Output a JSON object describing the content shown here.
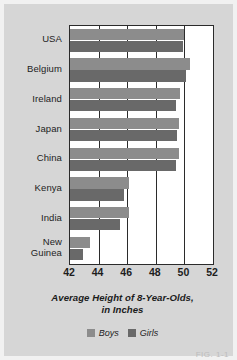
{
  "figure": {
    "caption": "FIG. 1-1",
    "background_color": "#d6d6d6",
    "frame_color": "#f1f1f1"
  },
  "legend": {
    "position": "bottom-center",
    "entries": [
      {
        "label": "Boys",
        "color": "#8c8c8c"
      },
      {
        "label": "Girls",
        "color": "#696969"
      }
    ]
  },
  "axis_title": {
    "line1": "Average Height of 8-Year-Olds,",
    "line2": "in Inches"
  },
  "chart_data": {
    "type": "bar",
    "orientation": "horizontal",
    "title": "Average Height of 8-Year-Olds, in Inches",
    "xlabel": "Average Height of 8-Year-Olds, in Inches",
    "ylabel": "",
    "xlim": [
      42,
      52
    ],
    "ylim": null,
    "xticks": [
      42,
      44,
      46,
      48,
      50,
      52
    ],
    "tick_labels": [
      "42",
      "44",
      "46",
      "48",
      "50",
      "52"
    ],
    "grid": true,
    "grid_axis": "x",
    "legend_position": "bottom-center",
    "categories": [
      "USA",
      "Belgium",
      "Ireland",
      "Japan",
      "China",
      "Kenya",
      "India",
      "New Guinea"
    ],
    "category_labels_multiline": {
      "New Guinea": [
        "New",
        "Guinea"
      ]
    },
    "series": [
      {
        "name": "Boys",
        "color": "#8c8c8c",
        "values": [
          50.0,
          50.4,
          49.7,
          49.6,
          49.6,
          46.1,
          46.1,
          43.4
        ]
      },
      {
        "name": "Girls",
        "color": "#696969",
        "values": [
          49.9,
          50.1,
          49.4,
          49.5,
          49.4,
          45.8,
          45.5,
          42.9
        ]
      }
    ],
    "units": "inches"
  }
}
